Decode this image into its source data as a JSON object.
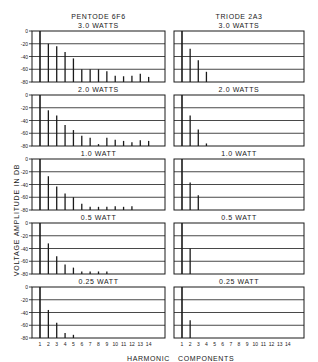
{
  "figure": {
    "left_column_title": "PENTODE 6F6",
    "right_column_title": "TRIODE 2A3",
    "y_axis_label": "VOLTAGE AMPLITUDE IN DB",
    "x_axis_label_left": "HARMONIC",
    "x_axis_label_right": "COMPONENTS"
  },
  "chart_data": [
    {
      "type": "bar",
      "title": "PENTODE 6F6 — 3.0 WATTS",
      "power": "3.0 WATTS",
      "tube": "PENTODE 6F6",
      "categories": [
        1,
        2,
        3,
        4,
        5,
        6,
        7,
        8,
        9,
        10,
        11,
        12,
        13,
        14
      ],
      "values": [
        0,
        -20,
        -24,
        -33,
        -43,
        -60,
        -60,
        -60,
        -63,
        -70,
        -71,
        -70,
        -67,
        -72
      ],
      "xlabel": "HARMONIC",
      "ylabel": "VOLTAGE AMPLITUDE IN DB",
      "ylim": [
        -80,
        0
      ],
      "yticks": [
        0,
        -20,
        -40,
        -60,
        -80
      ],
      "grid": true
    },
    {
      "type": "bar",
      "title": "TRIODE 2A3 — 3.0 WATTS",
      "power": "3.0 WATTS",
      "tube": "TRIODE 2A3",
      "categories": [
        1,
        2,
        3,
        4,
        5,
        6,
        7,
        8,
        9,
        10,
        11,
        12,
        13,
        14
      ],
      "values": [
        0,
        -28,
        -46,
        -64,
        null,
        null,
        null,
        null,
        null,
        null,
        null,
        null,
        null,
        null
      ],
      "xlabel": "COMPONENTS",
      "ylim": [
        -80,
        0
      ],
      "grid": true
    },
    {
      "type": "bar",
      "title": "PENTODE 6F6 — 2.0 WATTS",
      "power": "2.0 WATTS",
      "tube": "PENTODE 6F6",
      "categories": [
        1,
        2,
        3,
        4,
        5,
        6,
        7,
        8,
        9,
        10,
        11,
        12,
        13,
        14
      ],
      "values": [
        0,
        -24,
        -32,
        -47,
        -55,
        -64,
        -67,
        -77,
        -67,
        -70,
        -72,
        -74,
        -71,
        -72
      ],
      "ylim": [
        -80,
        0
      ],
      "yticks": [
        0,
        -20,
        -40,
        -60,
        -80
      ],
      "grid": true
    },
    {
      "type": "bar",
      "title": "TRIODE 2A3 — 2.0 WATTS",
      "power": "2.0 WATTS",
      "tube": "TRIODE 2A3",
      "categories": [
        1,
        2,
        3,
        4,
        5,
        6,
        7,
        8,
        9,
        10,
        11,
        12,
        13,
        14
      ],
      "values": [
        0,
        -32,
        -54,
        -76,
        null,
        null,
        null,
        null,
        null,
        null,
        null,
        null,
        null,
        null
      ],
      "ylim": [
        -80,
        0
      ],
      "grid": true
    },
    {
      "type": "bar",
      "title": "PENTODE 6F6 — 1.0 WATT",
      "power": "1.0 WATT",
      "tube": "PENTODE 6F6",
      "categories": [
        1,
        2,
        3,
        4,
        5,
        6,
        7,
        8,
        9,
        10,
        11,
        12,
        13,
        14
      ],
      "values": [
        0,
        -27,
        -43,
        -54,
        -60,
        -70,
        -75,
        -75,
        -75,
        -74,
        -75,
        -74,
        null,
        null
      ],
      "ylim": [
        -80,
        0
      ],
      "yticks": [
        0,
        -20,
        -40,
        -60,
        -80
      ],
      "grid": true
    },
    {
      "type": "bar",
      "title": "TRIODE 2A3 — 1.0 WATT",
      "power": "1.0 WATT",
      "tube": "TRIODE 2A3",
      "categories": [
        1,
        2,
        3,
        4,
        5,
        6,
        7,
        8,
        9,
        10,
        11,
        12,
        13,
        14
      ],
      "values": [
        0,
        -37,
        -57,
        null,
        null,
        null,
        null,
        null,
        null,
        null,
        null,
        null,
        null,
        null
      ],
      "ylim": [
        -80,
        0
      ],
      "grid": true
    },
    {
      "type": "bar",
      "title": "PENTODE 6F6 — 0.5 WATT",
      "power": "0.5 WATT",
      "tube": "PENTODE 6F6",
      "categories": [
        1,
        2,
        3,
        4,
        5,
        6,
        7,
        8,
        9,
        10,
        11,
        12,
        13,
        14
      ],
      "values": [
        0,
        -32,
        -52,
        -65,
        -70,
        -76,
        -76,
        -76,
        -76,
        null,
        null,
        null,
        null,
        null
      ],
      "ylim": [
        -80,
        0
      ],
      "yticks": [
        0,
        -20,
        -40,
        -60,
        -80
      ],
      "grid": true
    },
    {
      "type": "bar",
      "title": "TRIODE 2A3 — 0.5 WATT",
      "power": "0.5 WATT",
      "tube": "TRIODE 2A3",
      "categories": [
        1,
        2,
        3,
        4,
        5,
        6,
        7,
        8,
        9,
        10,
        11,
        12,
        13,
        14
      ],
      "values": [
        0,
        -40,
        null,
        null,
        null,
        null,
        null,
        null,
        null,
        null,
        null,
        null,
        null,
        null
      ],
      "ylim": [
        -80,
        0
      ],
      "grid": true
    },
    {
      "type": "bar",
      "title": "PENTODE 6F6 — 0.25 WATT",
      "power": "0.25 WATT",
      "tube": "PENTODE 6F6",
      "categories": [
        1,
        2,
        3,
        4,
        5,
        6,
        7,
        8,
        9,
        10,
        11,
        12,
        13,
        14
      ],
      "values": [
        0,
        -36,
        -56,
        -72,
        -75,
        null,
        null,
        null,
        null,
        null,
        null,
        null,
        null,
        null
      ],
      "xlabel": "HARMONIC",
      "ylim": [
        -80,
        0
      ],
      "yticks": [
        0,
        -20,
        -40,
        -60,
        -80
      ],
      "grid": true
    },
    {
      "type": "bar",
      "title": "TRIODE 2A3 — 0.25 WATT",
      "power": "0.25 WATT",
      "tube": "TRIODE 2A3",
      "categories": [
        1,
        2,
        3,
        4,
        5,
        6,
        7,
        8,
        9,
        10,
        11,
        12,
        13,
        14
      ],
      "values": [
        0,
        -52,
        null,
        null,
        null,
        null,
        null,
        null,
        null,
        null,
        null,
        null,
        null,
        null
      ],
      "xlabel": "COMPONENTS",
      "ylim": [
        -80,
        0
      ],
      "grid": true
    }
  ],
  "layout": {
    "ink_color": "#1a1a1a",
    "background_color": "#ffffff",
    "left_panel_x": 32,
    "left_panel_w": 133,
    "right_panel_x": 174,
    "right_panel_w": 130,
    "panel_tops": [
      31,
      95,
      159,
      223,
      287
    ],
    "panel_height": 51,
    "power_labels": [
      "3.0 WATTS",
      "2.0 WATTS",
      "1.0 WATT",
      "0.5 WATT",
      "0.25 WATT"
    ],
    "x_tick_labels": [
      "1",
      "2",
      "3",
      "4",
      "5",
      "6",
      "7",
      "8",
      "9",
      "10",
      "11",
      "12",
      "13",
      "14"
    ],
    "y_tick_labels": [
      "0",
      "-20",
      "-40",
      "-60",
      "-80"
    ]
  }
}
